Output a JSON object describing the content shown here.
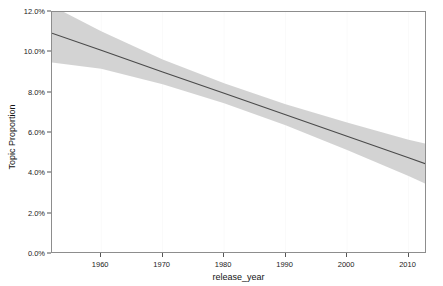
{
  "chart_data": {
    "type": "line",
    "title": "",
    "subtitle": "",
    "xlabel": "release_year",
    "ylabel": "Topic Proportion",
    "xlim": [
      1952,
      2013
    ],
    "ylim": [
      0.0,
      12.0
    ],
    "y_unit": "%",
    "grid": false,
    "legend": null,
    "y_ticks": [
      {
        "value": 0.0,
        "label": "0.0%"
      },
      {
        "value": 2.0,
        "label": "2.0%"
      },
      {
        "value": 4.0,
        "label": "4.0%"
      },
      {
        "value": 6.0,
        "label": "6.0%"
      },
      {
        "value": 8.0,
        "label": "8.0%"
      },
      {
        "value": 10.0,
        "label": "10.0%"
      },
      {
        "value": 12.0,
        "label": "12.0%"
      }
    ],
    "x_ticks": [
      {
        "value": 1960,
        "label": "1960"
      },
      {
        "value": 1970,
        "label": "1970"
      },
      {
        "value": 1980,
        "label": "1980"
      },
      {
        "value": 1990,
        "label": "1990"
      },
      {
        "value": 2000,
        "label": "2000"
      },
      {
        "value": 2010,
        "label": "2010"
      }
    ],
    "series": [
      {
        "name": "fitted trend",
        "kind": "line",
        "color": "#4a4a4a",
        "x": [
          1952,
          1960,
          1970,
          1980,
          1990,
          2000,
          2010,
          2013
        ],
        "values": [
          10.95,
          10.1,
          9.03,
          7.97,
          6.9,
          5.84,
          4.77,
          4.45
        ]
      }
    ],
    "ribbon": {
      "name": "confidence interval",
      "color": "#cbcbcb",
      "opacity": 0.85,
      "x": [
        1952,
        1960,
        1970,
        1980,
        1990,
        2000,
        2010,
        2013
      ],
      "lower": [
        9.5,
        9.18,
        8.42,
        7.47,
        6.38,
        5.16,
        3.87,
        3.45
      ],
      "upper": [
        12.3,
        11.05,
        9.64,
        8.47,
        7.42,
        6.52,
        5.67,
        5.45
      ]
    }
  }
}
